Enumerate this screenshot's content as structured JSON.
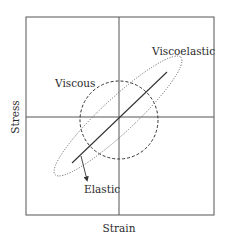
{
  "diagram": {
    "type": "stress-strain phase diagram",
    "x_axis_label": "Strain",
    "y_axis_label": "Stress",
    "curves": [
      {
        "name": "Elastic",
        "label": "Elastic",
        "style": "solid line",
        "color": "#333333"
      },
      {
        "name": "Viscous",
        "label": "Viscous",
        "style": "dashed circle",
        "color": "#333333"
      },
      {
        "name": "Viscoelastic",
        "label": "Viscoelastic",
        "style": "dotted ellipse",
        "color": "#555555"
      }
    ]
  },
  "labels": {
    "xlabel": "Strain",
    "ylabel": "Stress",
    "elastic": "Elastic",
    "viscous": "Viscous",
    "viscoelastic": "Viscoelastic"
  },
  "colors": {
    "frame": "#555555",
    "axes": "#555555",
    "curves": "#333333",
    "text": "#2a2a2a"
  }
}
